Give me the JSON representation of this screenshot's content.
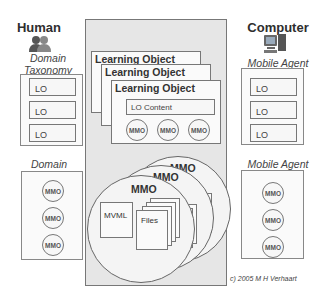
{
  "human": {
    "title": "Human",
    "icon": "people-icon",
    "taxonomy_label_line1": "Domain",
    "taxonomy_label_line2": "Taxonomy",
    "taxonomy_items": [
      "LO",
      "LO",
      "LO"
    ],
    "domain_label": "Domain",
    "domain_items": [
      "MMO",
      "MMO",
      "MMO"
    ]
  },
  "computer": {
    "title": "Computer",
    "icon": "computer-icon",
    "agent_label_top": "Mobile Agent",
    "agent_items_top": [
      "LO",
      "LO",
      "LO"
    ],
    "agent_label_bottom": "Mobile Agent",
    "agent_items_bottom": [
      "MMO",
      "MMO",
      "MMO"
    ]
  },
  "center": {
    "learning_objects": [
      "Learning Object",
      "Learning Object",
      "Learning Object"
    ],
    "lo_content": "LO Content",
    "lo_mmos": [
      "MMO",
      "MMO",
      "MMO"
    ],
    "mmo_circles": [
      "MMO",
      "MMO",
      "MMO"
    ],
    "mvml_label": "MVML",
    "files_label": "Files"
  },
  "copyright": "c) 2005 M H Verhaart",
  "colors": {
    "panel_bg": "#e6e6e6",
    "border": "#777777",
    "text": "#333333"
  }
}
